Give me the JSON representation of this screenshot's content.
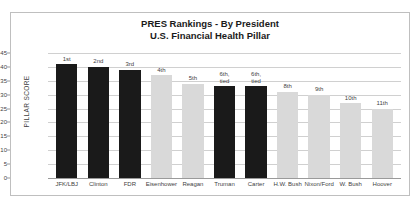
{
  "chart_data": {
    "type": "bar",
    "title": "PRES Rankings - By President",
    "subtitle": "U.S. Financial Health Pillar",
    "xlabel": "",
    "ylabel": "PILLAR SCORE",
    "ylim": [
      0,
      45
    ],
    "ytick_step": 5,
    "yticks": [
      45,
      40,
      35,
      30,
      25,
      20,
      15,
      10,
      5,
      0
    ],
    "grid": true,
    "legend": "none",
    "categories": [
      "JFK/LBJ",
      "Clinton",
      "FDR",
      "Eisenhower",
      "Reagan",
      "Truman",
      "Carter",
      "H.W. Bush",
      "Nixon/Ford",
      "W. Bush",
      "Hoover"
    ],
    "values": [
      41,
      40,
      39,
      37,
      34,
      33,
      33,
      31,
      30,
      27,
      25
    ],
    "point_labels": [
      "1st",
      "2nd",
      "3rd",
      "4th",
      "5th",
      "6th,\ntied",
      "6th,\ntied",
      "8th",
      "9th",
      "10th",
      "11th"
    ],
    "bar_colors": [
      "dark",
      "dark",
      "dark",
      "light",
      "light",
      "dark",
      "dark",
      "light",
      "light",
      "light",
      "light"
    ]
  },
  "colors": {
    "bar_dark": "#1a1a1a",
    "bar_light": "#d9d9d9",
    "gridline": "#d0d0d0",
    "axis": "#9a9a9a",
    "border": "#bfbfbf",
    "text": "#3f3f3f",
    "title": "#1a1a1a"
  }
}
